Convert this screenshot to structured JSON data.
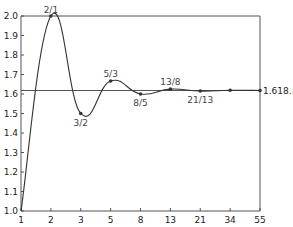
{
  "chart_data": {
    "type": "line",
    "title": "",
    "xlabel": "",
    "ylabel": "",
    "x_scale": "categorical (Fibonacci numbers, equally spaced)",
    "categories": [
      "1",
      "2",
      "3",
      "5",
      "8",
      "13",
      "21",
      "34",
      "55"
    ],
    "series": [
      {
        "name": "Ratio of consecutive Fibonacci numbers",
        "x": [
          1,
          2,
          3,
          5,
          8,
          13,
          21,
          34,
          55
        ],
        "values": [
          1.0,
          2.0,
          1.5,
          1.667,
          1.6,
          1.625,
          1.615,
          1.619,
          1.618
        ],
        "point_labels": [
          "",
          "2/1",
          "3/2",
          "5/3",
          "8/5",
          "13/8",
          "21/13",
          "",
          ""
        ]
      }
    ],
    "reference_line": {
      "value": 1.618,
      "label": "1.618..."
    },
    "yticks": [
      "1.0",
      "1.1",
      "1.2",
      "1.3",
      "1.4",
      "1.5",
      "1.6",
      "1.7",
      "1.8",
      "1.9",
      "2.0"
    ],
    "ylim": [
      1.0,
      2.0
    ],
    "grid": false,
    "legend": "none",
    "colors": {
      "line": "#333333",
      "axis": "#555555",
      "marker": "#333333"
    }
  }
}
